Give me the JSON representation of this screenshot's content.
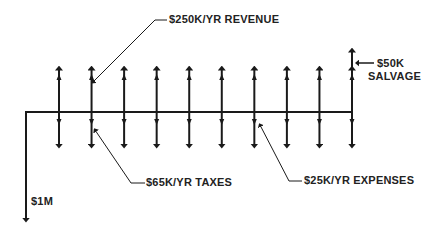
{
  "diagram": {
    "type": "cash-flow-diagram",
    "labels": {
      "revenue": "$250K/YR REVENUE",
      "salvage_line1": "$50K",
      "salvage_line2": "SALVAGE",
      "taxes": "$65K/YR TAXES",
      "expenses": "$25K/YR EXPENSES",
      "initial_investment": "$1M"
    },
    "periods": 10,
    "flows": {
      "initial_investment": -1000000,
      "annual_revenue": 250000,
      "annual_taxes": -65000,
      "annual_expenses": -25000,
      "salvage_final_year": 50000
    },
    "colors": {
      "line": "#1a1a1a",
      "text": "#222222",
      "background": "#ffffff"
    }
  }
}
